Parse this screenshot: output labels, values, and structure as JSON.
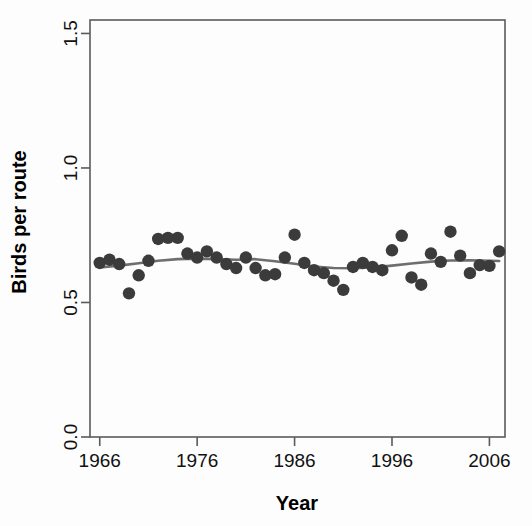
{
  "chart_data": {
    "type": "scatter",
    "title": "",
    "xlabel": "Year",
    "ylabel": "Birds per route",
    "xlim": [
      1965.0,
      2007.6
    ],
    "ylim": [
      0.0,
      1.55
    ],
    "grid": false,
    "legend": null,
    "x_ticks": [
      1966,
      1976,
      1986,
      1996,
      2006
    ],
    "x_tick_labels": [
      "1966",
      "1976",
      "1986",
      "1996",
      "2006"
    ],
    "y_ticks": [
      0.0,
      0.5,
      1.0,
      1.5
    ],
    "y_tick_labels": [
      "0.0",
      "0.5",
      "1.0",
      "1.5"
    ],
    "point_color": "#3b3b3b",
    "line_color": "#6e6e6e",
    "frame_color": "#5a5a5a",
    "series": [
      {
        "name": "Birds per route",
        "type": "scatter",
        "x": [
          1966,
          1967,
          1968,
          1969,
          1970,
          1971,
          1972,
          1973,
          1974,
          1975,
          1976,
          1977,
          1978,
          1979,
          1980,
          1981,
          1982,
          1983,
          1984,
          1985,
          1986,
          1987,
          1988,
          1989,
          1990,
          1991,
          1992,
          1993,
          1994,
          1995,
          1996,
          1997,
          1998,
          1999,
          2000,
          2001,
          2002,
          2003,
          2004,
          2005,
          2006,
          2007
        ],
        "y": [
          0.647,
          0.659,
          0.643,
          0.534,
          0.601,
          0.655,
          0.736,
          0.74,
          0.74,
          0.682,
          0.667,
          0.69,
          0.667,
          0.643,
          0.628,
          0.667,
          0.628,
          0.601,
          0.605,
          0.667,
          0.752,
          0.647,
          0.62,
          0.609,
          0.581,
          0.547,
          0.632,
          0.647,
          0.632,
          0.62,
          0.694,
          0.748,
          0.593,
          0.566,
          0.682,
          0.651,
          0.763,
          0.674,
          0.609,
          0.639,
          0.636,
          0.69
        ]
      },
      {
        "name": "smoothed trend",
        "type": "line",
        "x": [
          1966,
          1968,
          1970,
          1972,
          1974,
          1976,
          1978,
          1980,
          1982,
          1984,
          1986,
          1988,
          1990,
          1992,
          1994,
          1996,
          1998,
          2000,
          2002,
          2004,
          2006,
          2007
        ],
        "y": [
          0.63,
          0.637,
          0.646,
          0.655,
          0.661,
          0.663,
          0.661,
          0.659,
          0.661,
          0.653,
          0.644,
          0.634,
          0.628,
          0.627,
          0.63,
          0.637,
          0.645,
          0.652,
          0.656,
          0.657,
          0.655,
          0.654
        ]
      }
    ]
  },
  "axes": {
    "x_title": "Year",
    "y_title": "Birds per route"
  }
}
